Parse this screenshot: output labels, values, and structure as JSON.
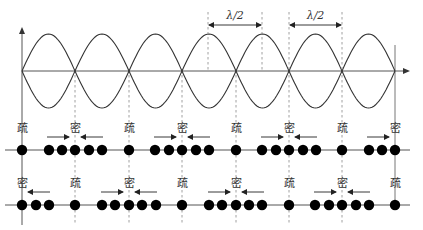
{
  "diagram": {
    "half_wavelength_label": "λ/2",
    "labels": {
      "sparse": "疏",
      "dense": "密"
    },
    "wave": {
      "nodes_x": [
        22,
        75,
        129,
        182,
        236,
        289,
        342,
        395
      ],
      "baseline_y": 71,
      "amplitude": 37
    },
    "dimension_markers": [
      {
        "label": "λ/2",
        "x1": 208,
        "x2": 262
      },
      {
        "label": "λ/2",
        "x1": 289,
        "x2": 342
      }
    ],
    "row1": {
      "y": 150,
      "label_y": 128,
      "labels": [
        {
          "text": "疏",
          "x": 22
        },
        {
          "text": "密",
          "x": 75
        },
        {
          "text": "疏",
          "x": 129
        },
        {
          "text": "密",
          "x": 182
        },
        {
          "text": "疏",
          "x": 236
        },
        {
          "text": "密",
          "x": 289
        },
        {
          "text": "疏",
          "x": 342
        },
        {
          "text": "密",
          "x": 395
        }
      ],
      "dots_x": [
        22,
        49,
        62,
        75,
        89,
        102,
        129,
        155,
        169,
        182,
        196,
        209,
        236,
        262,
        276,
        289,
        303,
        316,
        342,
        369,
        382,
        395
      ]
    },
    "row2": {
      "y": 205,
      "label_y": 183,
      "labels": [
        {
          "text": "密",
          "x": 22
        },
        {
          "text": "疏",
          "x": 75
        },
        {
          "text": "密",
          "x": 129
        },
        {
          "text": "疏",
          "x": 182
        },
        {
          "text": "密",
          "x": 236
        },
        {
          "text": "疏",
          "x": 289
        },
        {
          "text": "密",
          "x": 342
        },
        {
          "text": "疏",
          "x": 395
        }
      ],
      "dots_x": [
        22,
        36,
        49,
        75,
        102,
        115,
        129,
        142,
        156,
        182,
        209,
        222,
        236,
        249,
        262,
        289,
        315,
        329,
        342,
        356,
        369,
        395
      ]
    },
    "caption": "图 1  驻波中疏密分布示意图"
  }
}
